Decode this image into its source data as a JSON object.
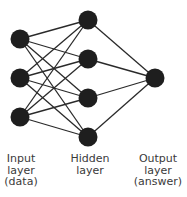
{
  "diagram": {
    "colors": {
      "node": "#1e1e1e",
      "edge": "#2a2a2a",
      "text": "#3a3a3a",
      "background": "#ffffff"
    },
    "layers": [
      {
        "name": "input",
        "label_lines": [
          "Input",
          "layer",
          "(data)"
        ],
        "x": 20,
        "nodes_y": [
          39,
          78,
          117
        ]
      },
      {
        "name": "hidden",
        "label_lines": [
          "Hidden",
          "layer"
        ],
        "x": 88,
        "nodes_y": [
          20,
          59,
          98,
          137
        ]
      },
      {
        "name": "output",
        "label_lines": [
          "Output",
          "layer",
          "(answer)"
        ],
        "x": 155,
        "nodes_y": [
          78
        ]
      }
    ],
    "node_radius": 9.5,
    "connectivity": "fully-connected"
  }
}
